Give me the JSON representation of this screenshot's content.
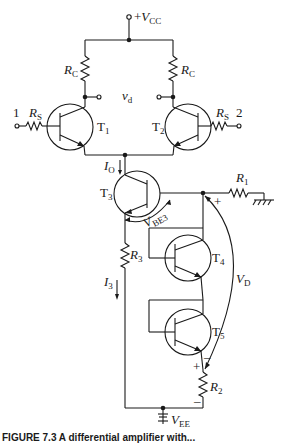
{
  "diagram": {
    "supply_top": {
      "prefix": "+",
      "symbol": "V",
      "sub": "CC"
    },
    "supply_bottom": {
      "symbol": "V",
      "sub": "EE"
    },
    "output": {
      "symbol": "v",
      "sub": "d"
    },
    "inputs": [
      {
        "label": "1"
      },
      {
        "label": "2"
      }
    ],
    "resistors": {
      "rc_left": {
        "symbol": "R",
        "sub": "C"
      },
      "rc_right": {
        "symbol": "R",
        "sub": "C"
      },
      "rs_left": {
        "symbol": "R",
        "sub": "S"
      },
      "rs_right": {
        "symbol": "R",
        "sub": "S"
      },
      "r1": {
        "symbol": "R",
        "sub": "1"
      },
      "r2": {
        "symbol": "R",
        "sub": "2"
      },
      "r3": {
        "symbol": "R",
        "sub": "3"
      }
    },
    "transistors": {
      "t1": {
        "symbol": "T",
        "sub": "1"
      },
      "t2": {
        "symbol": "T",
        "sub": "2"
      },
      "t3": {
        "symbol": "T",
        "sub": "3"
      },
      "t4": {
        "symbol": "T",
        "sub": "4"
      },
      "t5": {
        "symbol": "T",
        "sub": "5"
      }
    },
    "currents": {
      "io": {
        "symbol": "I",
        "sub": "O"
      },
      "i3": {
        "symbol": "I",
        "sub": "3"
      }
    },
    "voltages": {
      "vbe3": {
        "symbol": "V",
        "sub": "BE3"
      },
      "vd": {
        "symbol": "V",
        "sub": "D"
      },
      "plus": "+",
      "minus": "–"
    }
  },
  "caption": "FIGURE 7.3  A differential amplifier with..."
}
